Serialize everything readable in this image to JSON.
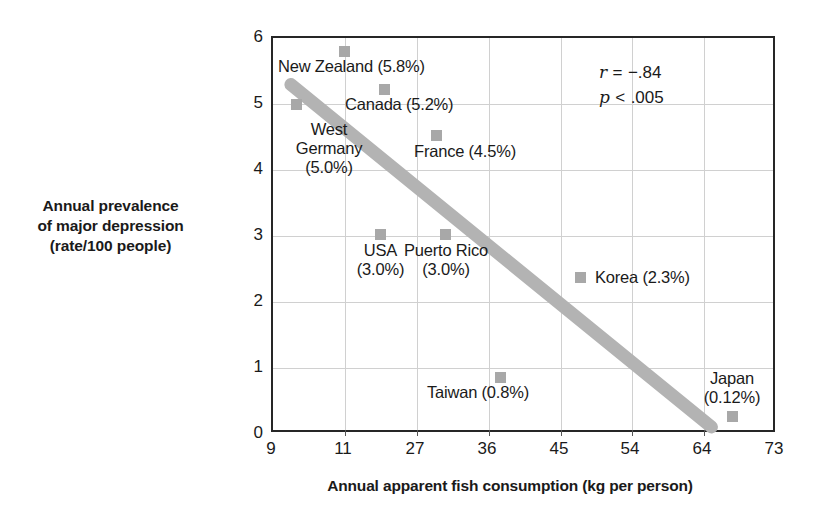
{
  "chart_data": {
    "type": "scatter",
    "title": "",
    "xlabel": "Annual apparent fish consumption (kg per person)",
    "ylabel_lines": [
      "Annual prevalence",
      "of major depression",
      "(rate/100 people)"
    ],
    "xticks": [
      "9",
      "11",
      "27",
      "36",
      "45",
      "54",
      "64",
      "73"
    ],
    "yticks": [
      "6",
      "5",
      "4",
      "3",
      "2",
      "1",
      "0"
    ],
    "ylim": [
      0,
      6
    ],
    "grid": true,
    "legend": "none",
    "marker_color": "#a8a8a8",
    "trendline_color": "#b3b3b3",
    "axis_color": "#262626",
    "points": [
      {
        "name": "New Zealand",
        "rate": "5.8",
        "label": "New Zealand (5.8%)",
        "px": 342,
        "py": 49,
        "label_x": 276,
        "label_y": 55,
        "align": "left"
      },
      {
        "name": "Canada",
        "rate": "5.2",
        "label": "Canada (5.2%)",
        "px": 382,
        "py": 87,
        "label_x": 343,
        "label_y": 93,
        "align": "left"
      },
      {
        "name": "West Germany",
        "rate": "5.0",
        "label": "West Germany (5.0%)",
        "px": 294,
        "py": 102,
        "label_x": 281,
        "label_y": 118,
        "align": "center"
      },
      {
        "name": "France",
        "rate": "4.5",
        "label": "France (4.5%)",
        "px": 434,
        "py": 133,
        "label_x": 412,
        "label_y": 140,
        "align": "left"
      },
      {
        "name": "USA",
        "rate": "3.0",
        "label": "USA (3.0%)",
        "px": 378,
        "py": 232,
        "label_x": 342,
        "label_y": 238,
        "align": "center"
      },
      {
        "name": "Puerto Rico",
        "rate": "3.0",
        "label": "Puerto Rico (3.0%)",
        "px": 443,
        "py": 232,
        "label_x": 406,
        "label_y": 238,
        "align": "center"
      },
      {
        "name": "Korea",
        "rate": "2.3",
        "label": "Korea (2.3%)",
        "px": 578,
        "py": 275,
        "label_x": 590,
        "label_y": 265,
        "align": "left"
      },
      {
        "name": "Taiwan",
        "rate": "0.8",
        "label": "Taiwan (0.8%)",
        "px": 498,
        "py": 375,
        "label_x": 425,
        "label_y": 381,
        "align": "left"
      },
      {
        "name": "Japan",
        "rate": "0.12",
        "label": "Japan (0.12%)",
        "px": 730,
        "py": 414,
        "label_x": 710,
        "label_y": 369,
        "align": "center"
      }
    ],
    "west_germany_label_lines": [
      "West",
      "Germany",
      "(5.0%)"
    ],
    "japan_label_lines": [
      "Japan",
      "(0.12%)"
    ],
    "trendline": {
      "x1": 289,
      "y1": 83,
      "x2": 713,
      "y2": 429
    },
    "annotation": {
      "correlation_symbol": "r",
      "correlation_op": "=",
      "correlation_value": "−.84",
      "pvalue_symbol": "p",
      "pvalue_op": "<",
      "pvalue_value": ".005"
    }
  }
}
